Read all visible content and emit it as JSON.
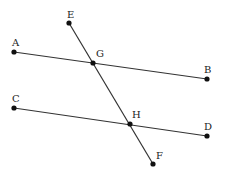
{
  "diagram": {
    "colors": {
      "line": "#333333",
      "point": "#111111",
      "label": "#222222",
      "background": "#ffffff"
    },
    "points": {
      "A": {
        "label": "A",
        "x": 14,
        "y": 52,
        "lx": 12,
        "ly": 46
      },
      "B": {
        "label": "B",
        "x": 207,
        "y": 79,
        "lx": 204,
        "ly": 73
      },
      "C": {
        "label": "C",
        "x": 14,
        "y": 108,
        "lx": 12,
        "ly": 102
      },
      "D": {
        "label": "D",
        "x": 207,
        "y": 136,
        "lx": 204,
        "ly": 130
      },
      "E": {
        "label": "E",
        "x": 69,
        "y": 23,
        "lx": 67,
        "ly": 18
      },
      "F": {
        "label": "F",
        "x": 153,
        "y": 164,
        "lx": 156,
        "ly": 159
      },
      "G": {
        "label": "G",
        "x": 93,
        "y": 63,
        "lx": 96,
        "ly": 57
      },
      "H": {
        "label": "H",
        "x": 130,
        "y": 124,
        "lx": 132,
        "ly": 118
      }
    },
    "segments": [
      {
        "name": "line-AB",
        "from": "A",
        "to": "B"
      },
      {
        "name": "line-CD",
        "from": "C",
        "to": "D"
      },
      {
        "name": "line-EF",
        "from": "E",
        "to": "F"
      }
    ]
  }
}
